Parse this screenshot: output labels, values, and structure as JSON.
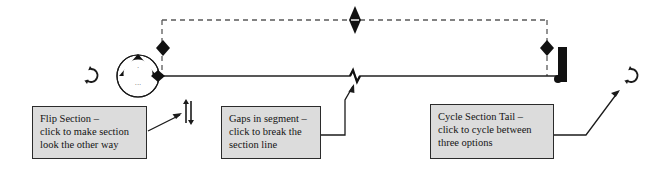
{
  "diagram": {
    "colors": {
      "ink": "#1a1a1a",
      "callout_fill": "#dcdcdc",
      "callout_border": "#2b2b2b",
      "dashed_guide": "#555555",
      "section_line": "#222222"
    },
    "elements": {
      "section_head_bubble": "section-head-bubble",
      "section_head_arrow": "filled-triangle-view-arrow",
      "section_line": "horizontal-section-line",
      "dashed_extent_box": "dashed-extent-rectangle",
      "grip_left": "diamond-grip-left",
      "grip_top": "diamond-grip-top",
      "grip_right": "diamond-grip-right",
      "gap_break": "zigzag-gap-break",
      "section_tail": "section-tail-bar",
      "rotate_left": "rotate-icon-left",
      "rotate_right": "rotate-icon-right",
      "flip_arrows": "flip-double-arrow-icon"
    },
    "head_label": {
      "mark": "·",
      "sheet": "···"
    }
  },
  "callouts": [
    {
      "id": "flip-section",
      "title": "Flip Section –",
      "line2": "click to make section",
      "line3": "look the other way",
      "text": "Flip Section –\nclick to make section\nlook the other way"
    },
    {
      "id": "gaps-in-segment",
      "title": "Gaps in segment –",
      "line2": "click to break the",
      "line3": "section line",
      "text": "Gaps in segment –\nclick to break the\nsection line"
    },
    {
      "id": "cycle-section-tail",
      "title": "Cycle Section Tail –",
      "line2": "click to cycle between",
      "line3": "three options",
      "text": "Cycle Section Tail –\nclick to cycle between\nthree options"
    }
  ]
}
